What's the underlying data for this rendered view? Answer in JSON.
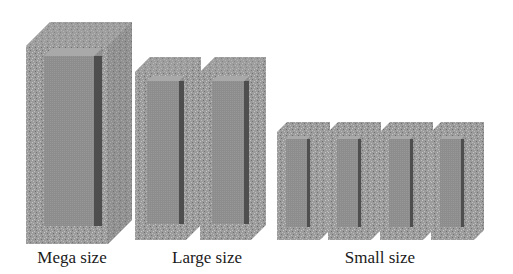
{
  "colors": {
    "frame": "#9c9c9c",
    "frame_speck_light": "#c4c4c4",
    "frame_speck_dark": "#6e6e6e",
    "inner_face": "#8d8d8d",
    "inner_shadow": "#4e4e4e",
    "inner_top": "#a8a8a8",
    "text": "#1a1a1a"
  },
  "groups": [
    {
      "id": "mega",
      "label": "Mega size",
      "count": 1
    },
    {
      "id": "large",
      "label": "Large size",
      "count": 2
    },
    {
      "id": "small",
      "label": "Small size",
      "count": 4
    }
  ]
}
